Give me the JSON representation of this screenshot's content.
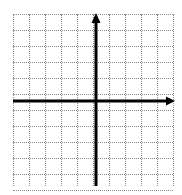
{
  "figure": {
    "kind": "cartesian-coordinate-plane",
    "background_color": "#ffffff",
    "title": "",
    "caption": "",
    "width_px": 182,
    "height_px": 195
  },
  "chart_data": {
    "type": "scatter",
    "title": "",
    "subtitle": "",
    "xlabel": "",
    "ylabel": "",
    "x": [],
    "y": [],
    "series": [],
    "annotations": [],
    "legend": {
      "entries": [],
      "position": "none",
      "visible": false
    },
    "grid": {
      "visible": true,
      "style": "dotted",
      "color": "#8c8c8c",
      "cell_size_px": 16,
      "columns": 10,
      "rows": 11,
      "left_px": 13,
      "top_px": 14,
      "right_px": 173,
      "bottom_px": 186
    },
    "axes": {
      "color": "#000000",
      "stroke_width_px": 3,
      "origin_px": {
        "x": 96,
        "y": 101
      },
      "x_axis": {
        "label": "",
        "tick_labels": [],
        "start_px": 13,
        "end_px": 175,
        "arrow_start": false,
        "arrow_end": true
      },
      "y_axis": {
        "label": "",
        "tick_labels": [],
        "start_px": 186,
        "end_px": 13,
        "arrow_start": false,
        "arrow_end": true
      },
      "xlim": [
        -5.2,
        4.9
      ],
      "ylim": [
        -5.3,
        5.5
      ],
      "tick_interval": 1,
      "tick_marks_visible": false,
      "numbers_visible": false
    }
  }
}
